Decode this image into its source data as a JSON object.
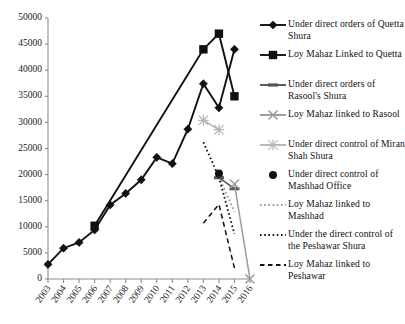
{
  "chart_data": {
    "type": "line",
    "title": "",
    "xlabel": "",
    "ylabel": "",
    "ylim": [
      0,
      50000
    ],
    "xlim": [
      2003,
      2016
    ],
    "grid": false,
    "legend_position": "right",
    "ytick_labels": [
      "0",
      "5000",
      "10000",
      "15000",
      "20000",
      "25000",
      "30000",
      "35000",
      "40000",
      "45000",
      "50000"
    ],
    "ytick_values": [
      0,
      5000,
      10000,
      15000,
      20000,
      25000,
      30000,
      35000,
      40000,
      45000,
      50000
    ],
    "categories": [
      2003,
      2004,
      2005,
      2006,
      2007,
      2008,
      2009,
      2010,
      2011,
      2012,
      2013,
      2014,
      2015,
      2016
    ],
    "xtick_labels": [
      "2003",
      "2004",
      "2005",
      "2006",
      "2007",
      "2008",
      "2009",
      "2010",
      "2011",
      "2012",
      "2013",
      "2014",
      "2015",
      "2016"
    ],
    "series": [
      {
        "name": "Under direct orders of Quetta Shura",
        "marker": "diamond",
        "color": "#111111",
        "linestyle": "solid",
        "x": [
          2003,
          2004,
          2005,
          2006,
          2007,
          2008,
          2009,
          2010,
          2011,
          2012,
          2013,
          2014,
          2015
        ],
        "values": [
          2800,
          5900,
          7000,
          9400,
          14200,
          16400,
          19000,
          23300,
          22100,
          28700,
          37400,
          32800,
          44000
        ]
      },
      {
        "name": "Loy Mahaz Linked to Quetta",
        "marker": "square",
        "color": "#111111",
        "linestyle": "solid",
        "x": [
          2006,
          2013,
          2014,
          2015
        ],
        "values": [
          10200,
          44000,
          47000,
          35000
        ]
      },
      {
        "name": "Under direct orders of Rasool's Shura",
        "marker": "dash",
        "color": "#555555",
        "linestyle": "solid",
        "x": [
          2014,
          2015
        ],
        "values": [
          19400,
          17300
        ]
      },
      {
        "name": "Loy Mahaz linked to Rasool",
        "marker": "x",
        "color": "#9a9a9a",
        "linestyle": "solid",
        "x": [
          2015,
          2016
        ],
        "values": [
          18200,
          0
        ]
      },
      {
        "name": "Under direct control of Miran Shah Shura",
        "marker": "asterisk",
        "color": "#b5b5b5",
        "linestyle": "solid",
        "x": [
          2013,
          2014
        ],
        "values": [
          30400,
          28600
        ]
      },
      {
        "name": "Under direct control of Mashhad Office",
        "marker": "circle",
        "color": "#111111",
        "linestyle": "none",
        "x": [
          2014
        ],
        "values": [
          20200
        ]
      },
      {
        "name": "Loy Mahaz linked to Mashhad",
        "marker": "dotted-line",
        "color": "#9a9a9a",
        "linestyle": "dotted",
        "x": [
          2014,
          2015
        ],
        "values": [
          19600,
          12900
        ]
      },
      {
        "name": "Under the direct control of the Peshawar Shura",
        "marker": "dotted-line",
        "color": "#111111",
        "linestyle": "dotted",
        "x": [
          2013,
          2014,
          2015
        ],
        "values": [
          26200,
          19500,
          8600
        ]
      },
      {
        "name": "Loy Mahaz linked to Peshawar",
        "marker": "dashed-line",
        "color": "#111111",
        "linestyle": "dashed",
        "x": [
          2013,
          2014,
          2015
        ],
        "values": [
          10700,
          14300,
          2100
        ]
      }
    ]
  },
  "legend": {
    "items": [
      {
        "label": "Under direct orders of Quetta Shura",
        "marker": "diamond"
      },
      {
        "label": "Loy Mahaz Linked to Quetta",
        "marker": "square"
      },
      {
        "label": "Under direct orders of Rasool's Shura",
        "marker": "dash"
      },
      {
        "label": "Loy Mahaz linked to Rasool",
        "marker": "x"
      },
      {
        "label": "Under direct control of Miran Shah Shura",
        "marker": "asterisk"
      },
      {
        "label": "Under direct control of Mashhad Office",
        "marker": "circle"
      },
      {
        "label": "Loy Mahaz linked to Mashhad",
        "marker": "dotted-gray"
      },
      {
        "label": "Under the direct control of the Peshawar Shura",
        "marker": "dotted-black"
      },
      {
        "label": "Loy Mahaz linked to Peshawar",
        "marker": "dashed-black"
      }
    ]
  }
}
